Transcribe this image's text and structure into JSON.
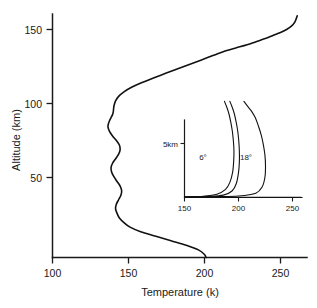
{
  "chart_data": {
    "type": "line",
    "title": "",
    "xlabel": "Temperature (k)",
    "ylabel": "Altitude (km)",
    "xlim": [
      100,
      262
    ],
    "ylim": [
      0,
      160
    ],
    "grid": false,
    "legend": "none",
    "x_ticks": [
      "100",
      "150",
      "200",
      "250"
    ],
    "x_tick_values": [
      100,
      150,
      200,
      250
    ],
    "y_ticks": [
      "50",
      "100",
      "150"
    ],
    "y_tick_values": [
      50,
      100,
      150
    ],
    "series": [
      {
        "name": "atmospheric temperature profile",
        "x": [
          201,
          200,
          196,
          188,
          178,
          168,
          158,
          151,
          147,
          144,
          142.5,
          141.5,
          142,
          143.5,
          145,
          145.5,
          144.5,
          142.5,
          140.5,
          139,
          138.5,
          139.5,
          141.5,
          143.5,
          144.5,
          144,
          142,
          139.5,
          137.5,
          136.5,
          136.8,
          137.5,
          138.5,
          139.5,
          140,
          140.2,
          140.5,
          141.5,
          143.5,
          147,
          152,
          158.5,
          166,
          174,
          182,
          190,
          198,
          206,
          214,
          221,
          228,
          234,
          240,
          245,
          250,
          254,
          257,
          259.5,
          261
        ],
        "y": [
          0,
          2,
          5,
          8,
          11,
          14,
          17,
          20,
          23,
          26,
          29,
          32,
          35,
          38,
          41,
          44,
          47,
          50,
          53,
          56,
          59,
          62,
          65,
          68,
          71,
          74,
          77,
          80,
          83,
          86,
          88,
          90,
          92,
          94,
          96,
          98,
          100,
          103,
          106,
          109,
          112,
          115,
          118,
          121,
          124,
          127,
          130,
          133,
          136,
          138,
          140,
          142,
          144,
          146,
          148,
          150,
          152,
          155,
          159
        ]
      }
    ],
    "inset": {
      "type": "line",
      "xlim": [
        150,
        258
      ],
      "ylim": [
        0,
        9
      ],
      "x_ticks": [
        "150",
        "200",
        "250"
      ],
      "x_tick_values": [
        150,
        200,
        250
      ],
      "y_ticks": [
        "5km"
      ],
      "y_tick_values": [
        5
      ],
      "annotations": [
        {
          "text": "6°",
          "x": 186,
          "y": 4.2
        },
        {
          "text": "18°",
          "x": 215,
          "y": 4.2
        }
      ],
      "series": [
        {
          "name": "6 degree",
          "x": [
            150,
            168,
            180,
            188,
            192,
            194.5,
            195.5,
            195.8,
            195.2,
            194.2,
            192.8,
            191,
            189,
            187
          ],
          "y": [
            0.05,
            0.12,
            0.3,
            0.75,
            1.4,
            2.3,
            3.3,
            4.3,
            5.3,
            6.2,
            7.0,
            7.8,
            8.4,
            8.9
          ]
        },
        {
          "name": "middle",
          "x": [
            150,
            172,
            186,
            194,
            198,
            200,
            200.8,
            200.8,
            200.2,
            199.2,
            197.8,
            196,
            194,
            192
          ],
          "y": [
            0.05,
            0.1,
            0.22,
            0.6,
            1.3,
            2.3,
            3.3,
            4.3,
            5.3,
            6.2,
            7.0,
            7.8,
            8.4,
            8.9
          ]
        },
        {
          "name": "18 degree",
          "x": [
            150,
            180,
            200,
            216,
            222,
            224.5,
            225,
            224.5,
            223,
            221,
            218.5,
            215.5,
            212,
            208,
            205
          ],
          "y": [
            0.05,
            0.08,
            0.14,
            0.4,
            1.0,
            1.9,
            2.9,
            3.9,
            4.9,
            5.8,
            6.6,
            7.4,
            8.0,
            8.5,
            8.9
          ]
        },
        {
          "name": "baseline",
          "x": [
            150,
            200,
            258
          ],
          "y": [
            0.02,
            0.02,
            0.02
          ]
        }
      ]
    }
  },
  "labels": {
    "x_axis_title": "Temperature (k)",
    "y_axis_title": "Altitude (km)",
    "x_tick_0": "100",
    "x_tick_1": "150",
    "x_tick_2": "200",
    "x_tick_3": "250",
    "y_tick_0": "50",
    "y_tick_1": "100",
    "y_tick_2": "150",
    "inset_y_tick_0": "5km",
    "inset_x_tick_0": "150",
    "inset_x_tick_1": "200",
    "inset_x_tick_2": "250",
    "inset_annotation_0": "6°",
    "inset_annotation_1": "18°"
  },
  "colors": {
    "curve": "#111111",
    "axis": "#1a1a1a",
    "background": "#ffffff"
  }
}
